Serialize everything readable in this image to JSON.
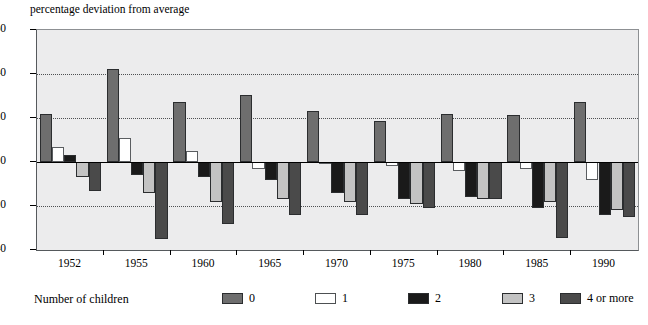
{
  "chart_data": {
    "type": "bar",
    "title": "",
    "ylabel": "percentage deviation from average",
    "xlabel": "",
    "ylim": [
      -40,
      60
    ],
    "yticks": [
      60,
      40,
      20,
      0,
      -20,
      -40
    ],
    "ytick_labels": [
      "60",
      "40",
      "20",
      "0",
      "-20",
      "-40"
    ],
    "grid": true,
    "grid_values": [
      40,
      20,
      -20
    ],
    "zero_line": 0,
    "legend_position": "bottom",
    "legend_title": "Number of children",
    "categories": [
      "1952",
      "1955",
      "1960",
      "1965",
      "1970",
      "1975",
      "1980",
      "1985",
      "1990"
    ],
    "series": [
      {
        "name": "0",
        "color": "#6e6e6e",
        "values": [
          22,
          42.5,
          27.5,
          30.5,
          23,
          18.5,
          22,
          21.5,
          27.5
        ]
      },
      {
        "name": "1",
        "color": "#ffffff",
        "values": [
          7,
          11,
          5,
          -3,
          0,
          -2,
          -4,
          -3,
          -8
        ]
      },
      {
        "name": "2",
        "color": "#1a1a1a",
        "values": [
          3,
          -6,
          -7,
          -8,
          -14,
          -17,
          -16,
          -21,
          -24
        ]
      },
      {
        "name": "3",
        "color": "#c3c3c3",
        "values": [
          -7,
          -14,
          -18,
          -17,
          -18,
          -19,
          -17,
          -18,
          -22
        ]
      },
      {
        "name": "4 or more",
        "color": "#4a4a4a",
        "values": [
          -13,
          -35,
          -28,
          -24,
          -24,
          -21,
          -17,
          -34.5,
          -25
        ]
      }
    ]
  },
  "legend": {
    "title": "Number of children",
    "entries": [
      {
        "label": "0",
        "swatch_color": "#6e6e6e"
      },
      {
        "label": "1",
        "swatch_color": "#ffffff"
      },
      {
        "label": "2",
        "swatch_color": "#1a1a1a"
      },
      {
        "label": "3",
        "swatch_color": "#c3c3c3"
      },
      {
        "label": "4 or more",
        "swatch_color": "#4a4a4a"
      }
    ]
  },
  "colors": {
    "plot_background": "#ececed",
    "axis": "#000000",
    "gridline": "#4d5052"
  }
}
